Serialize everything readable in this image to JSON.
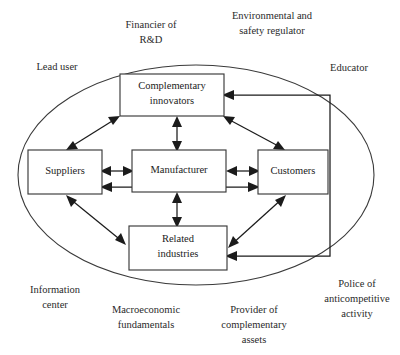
{
  "figure": {
    "shape": "ellipse-boundary-with-core-network"
  },
  "nodes": [
    {
      "id": "complementary-innovators",
      "line1": "Complementary",
      "line2": "innovators"
    },
    {
      "id": "suppliers",
      "line1": "Suppliers",
      "line2": ""
    },
    {
      "id": "manufacturer",
      "line1": "Manufacturer",
      "line2": ""
    },
    {
      "id": "customers",
      "line1": "Customers",
      "line2": ""
    },
    {
      "id": "related-industries",
      "line1": "Related",
      "line2": "industries"
    }
  ],
  "outer_labels": [
    {
      "id": "financier-of-rd",
      "line1": "Financier of",
      "line2": "R&D",
      "line3": ""
    },
    {
      "id": "environmental-and-safety-regulator",
      "line1": "Environmental and",
      "line2": "safety regulator",
      "line3": ""
    },
    {
      "id": "lead-user",
      "line1": "Lead user",
      "line2": "",
      "line3": ""
    },
    {
      "id": "educator",
      "line1": "Educator",
      "line2": "",
      "line3": ""
    },
    {
      "id": "information-center",
      "line1": "Information",
      "line2": "center",
      "line3": ""
    },
    {
      "id": "macroeconomic-fundamentals",
      "line1": "Macroeconomic",
      "line2": "fundamentals",
      "line3": ""
    },
    {
      "id": "provider-of-complementary-assets",
      "line1": "Provider of",
      "line2": "complementary",
      "line3": "assets"
    },
    {
      "id": "police-of-anticompetitive-activity",
      "line1": "Police of",
      "line2": "anticompetitive",
      "line3": "activity"
    }
  ],
  "colors": {
    "stroke": "#1b1b1b",
    "box_stroke": "#3a3a3a",
    "background": "#ffffff",
    "text": "#2a2a2a"
  }
}
